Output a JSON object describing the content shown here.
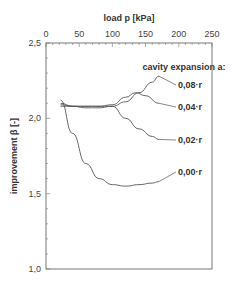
{
  "chart_data": {
    "type": "line",
    "title": "",
    "xlabel": "load p [kPa]",
    "ylabel": "improvement β [-]",
    "xlim": [
      0,
      250
    ],
    "ylim": [
      1.0,
      2.5
    ],
    "x_ticks": [
      "0",
      "50",
      "100",
      "150",
      "200",
      "250"
    ],
    "y_ticks": [
      "1,0",
      "1,5",
      "2,0",
      "2,5"
    ],
    "x_axis_position": "top",
    "grid": false,
    "legend_title": "cavity expansion a:",
    "series": [
      {
        "name": "0,08·r",
        "x": [
          22,
          40,
          60,
          80,
          100,
          120,
          140,
          160,
          170
        ],
        "values": [
          2.1,
          2.08,
          2.07,
          2.07,
          2.08,
          2.11,
          2.17,
          2.24,
          2.28
        ]
      },
      {
        "name": "0,04·r",
        "x": [
          22,
          40,
          60,
          80,
          100,
          120,
          135,
          150,
          170
        ],
        "values": [
          2.09,
          2.08,
          2.08,
          2.08,
          2.09,
          2.14,
          2.17,
          2.15,
          2.1
        ]
      },
      {
        "name": "0,02·r",
        "x": [
          22,
          40,
          60,
          80,
          100,
          120,
          140,
          160,
          170
        ],
        "values": [
          2.08,
          2.08,
          2.08,
          2.08,
          2.08,
          2.0,
          1.93,
          1.88,
          1.86
        ]
      },
      {
        "name": "0,00·r",
        "x": [
          22,
          40,
          60,
          80,
          100,
          120,
          140,
          160,
          170
        ],
        "values": [
          2.12,
          1.9,
          1.7,
          1.6,
          1.56,
          1.55,
          1.56,
          1.57,
          1.58
        ]
      }
    ]
  }
}
